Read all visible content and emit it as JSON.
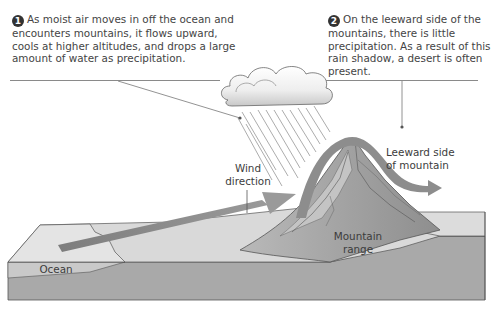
{
  "figure": {
    "callouts": [
      {
        "number": "1",
        "text": "As moist air moves in off the ocean and encounters mountains, it flows upward, cools at higher altitudes, and drops a large amount of water as precipitation."
      },
      {
        "number": "2",
        "text": "On the leeward side of the mountains, there is little precipitation. As a result of this rain shadow, a desert is often present."
      }
    ],
    "labels": {
      "wind": "Wind direction",
      "leeward": "Leeward side of mountain",
      "mountain": "Mountain range",
      "ocean": "Ocean"
    },
    "colors": {
      "background": "#ffffff",
      "land_top": "#d6d6d6",
      "land_front": "#a8a8a8",
      "mountain": "#9a9a9a",
      "mountain_light": "#bdbdbd",
      "arrow": "#8c8c8c",
      "cloud": "#f2f2f2",
      "text": "#444444"
    }
  }
}
